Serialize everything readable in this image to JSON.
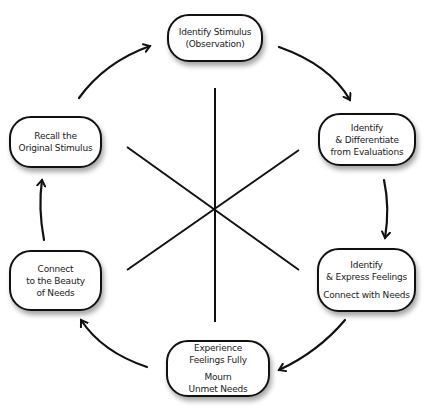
{
  "diagram": {
    "type": "cycle",
    "nodes": [
      {
        "id": "n1",
        "lines": [
          "Identify Stimulus",
          "(Observation)"
        ]
      },
      {
        "id": "n2",
        "lines": [
          "Identify",
          "& Differentiate",
          "from Evaluations"
        ]
      },
      {
        "id": "n3",
        "lines": [
          "Identify",
          "& Express Feelings"
        ],
        "lines2": [
          "Connect with Needs"
        ]
      },
      {
        "id": "n4",
        "lines": [
          "Experience",
          "Feelings Fully"
        ],
        "lines2": [
          "Mourn",
          "Unmet Needs"
        ]
      },
      {
        "id": "n5",
        "lines": [
          "Connect",
          "to the Beauty",
          "of Needs"
        ]
      },
      {
        "id": "n6",
        "lines": [
          "Recall the",
          "Original Stimulus"
        ]
      }
    ],
    "edges": [
      {
        "from": "n1",
        "to": "n2"
      },
      {
        "from": "n2",
        "to": "n3"
      },
      {
        "from": "n3",
        "to": "n4"
      },
      {
        "from": "n4",
        "to": "n5"
      },
      {
        "from": "n5",
        "to": "n6"
      },
      {
        "from": "n6",
        "to": "n1"
      }
    ],
    "colors": {
      "stroke": "#111111",
      "background": "#ffffff"
    }
  }
}
